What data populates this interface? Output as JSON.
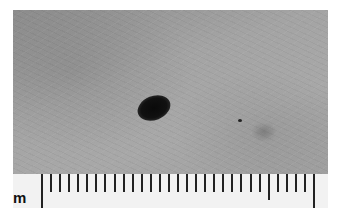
{
  "image": {
    "description": "Grayscale close-up photo of skin with a dark oval lesion, with a metric ruler along the bottom edge",
    "subject": "dark pigmented skin lesion",
    "ruler": {
      "unit_label": "m",
      "major_ticks_x": [
        41,
        127,
        219,
        313
      ],
      "medium_ticks_x": [
        83,
        172,
        266
      ],
      "minor_tick_spacing_px": 9
    },
    "colors": {
      "skin": "#a0a0a0",
      "lesion": "#0d0d0d",
      "ruler": "#f2f2f2",
      "ticks": "#222222"
    }
  }
}
